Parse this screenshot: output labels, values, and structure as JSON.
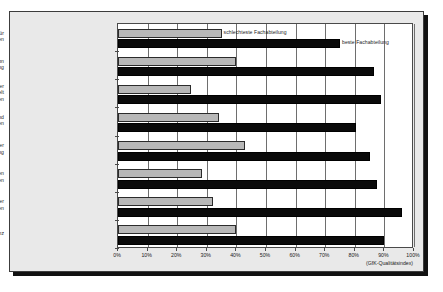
{
  "chart_data": {
    "type": "bar",
    "orientation": "horizontal",
    "title": "",
    "xlabel": "(GfK-Qualitätsindex)",
    "ylabel": "",
    "xlim": [
      0,
      100
    ],
    "grid": true,
    "legend_position": "in-plot-annotations",
    "categories": [
      "Hotel- und Serviceleistungen für die Patienten",
      "Interne Organisation der Krankenhausabteilung",
      "Wunsch der Patienten, in dieser Krankenhausabteilung behandelt zu werden",
      "Persönliche Betreuung und Zuwendung für die Patienten",
      "Pflegequalität in der Krankenhausabteilung",
      "Kommunikation mit den niedergelassenen Ärzten",
      "Angemessenheit der Krankenhausleistungen",
      "Medizinische Kompetenz"
    ],
    "category_lines": [
      [
        "Hotel- und Serviceleistungen für",
        "die Patienten"
      ],
      [
        "Interne Organisation",
        "der Krankenhausabteilung"
      ],
      [
        "Wunsch der Patienten, in dieser",
        "Krankenhausabteilung behandelt",
        "zu werden"
      ],
      [
        "Persönliche Betreuung und",
        "Zuwendung für die Patienten"
      ],
      [
        "Pflegequalität in der",
        "Krankenhausabteilung"
      ],
      [
        "Kommunikation mit den",
        "niedergelassenen Ärzten"
      ],
      [
        "Angemessenheit der",
        "Krankenhausleistungen"
      ],
      [
        "Medizinische Kompetenz"
      ]
    ],
    "series": [
      {
        "name": "schlechteste Fachabteilung",
        "color": "#b8b8b8",
        "values": [
          35,
          40,
          24.5,
          34,
          43,
          28.5,
          32,
          40
        ]
      },
      {
        "name": "beste Fachabteilung",
        "color": "#0a0a0a",
        "values": [
          75,
          86.5,
          89,
          80.5,
          85,
          87.5,
          96,
          90
        ]
      }
    ],
    "xticks": [
      0,
      10,
      20,
      30,
      40,
      50,
      60,
      70,
      80,
      90,
      100
    ],
    "xtick_labels": [
      "0%",
      "10%",
      "20%",
      "30%",
      "40%",
      "50%",
      "60%",
      "70%",
      "80%",
      "90%",
      "100%"
    ],
    "annotations": [
      {
        "text": "schlechteste Fachabteilung",
        "series": "schlechteste Fachabteilung",
        "category_index": 0
      },
      {
        "text": "beste Fachabteilung",
        "series": "beste Fachabteilung",
        "category_index": 0
      }
    ]
  }
}
